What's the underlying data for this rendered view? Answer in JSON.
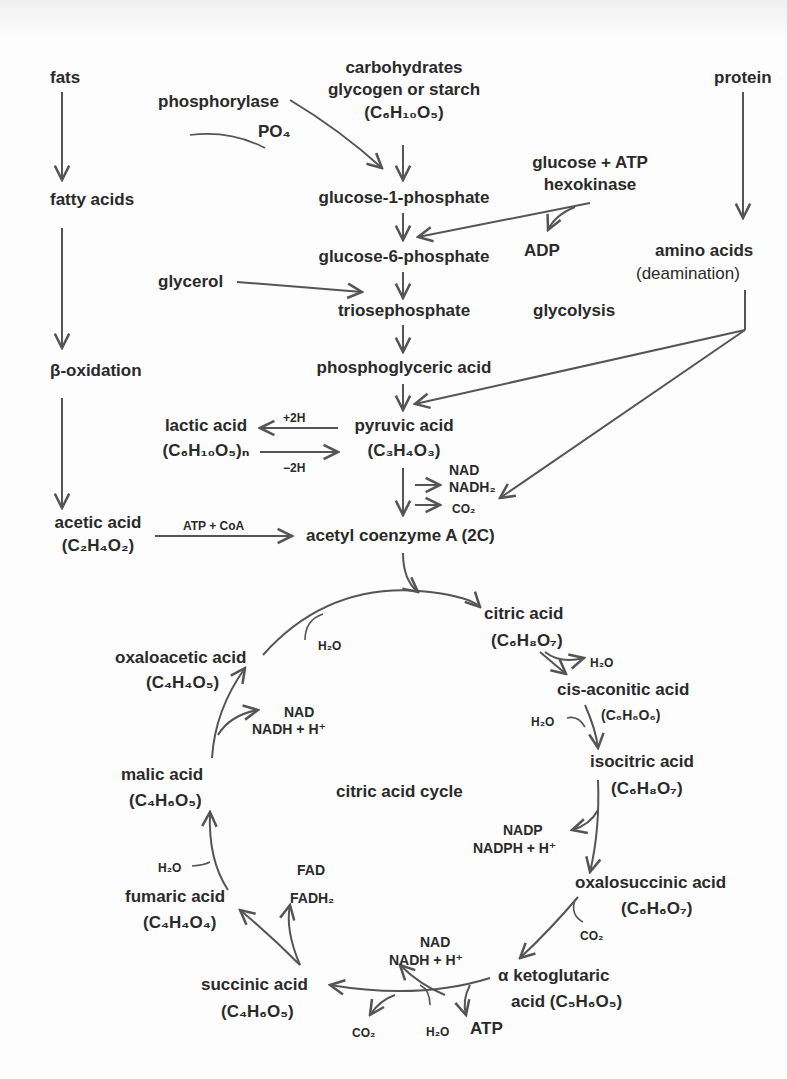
{
  "diagram": {
    "colors": {
      "ink": "#2a2a2a",
      "arrow": "#555555",
      "background": "#fdfdfd"
    },
    "sources": {
      "fats": "fats",
      "carbohydrates": "carbohydrates",
      "glycogen": "glycogen or starch",
      "glycogen_formula": "(C₆H₁₀O₅)",
      "protein": "protein"
    },
    "fat_pathway": {
      "fatty_acids": "fatty acids",
      "beta_oxidation": "β-oxidation",
      "acetic_acid": "acetic acid",
      "acetic_formula": "(C₂H₄O₂)",
      "atp_coa": "ATP + CoA"
    },
    "glycolysis": {
      "label": "glycolysis",
      "phosphorylase": "phosphorylase",
      "po4": "PO₄",
      "glucose_1_phosphate": "glucose-1-phosphate",
      "glucose_atp": "glucose + ATP",
      "hexokinase": "hexokinase",
      "adp": "ADP",
      "glucose_6_phosphate": "glucose-6-phosphate",
      "glycerol": "glycerol",
      "triosephosphate": "triosephosphate",
      "phosphoglyceric_acid": "phosphoglyceric acid",
      "pyruvic_acid": "pyruvic acid",
      "pyruvic_formula": "(C₃H₄O₃)",
      "lactic_acid": "lactic acid",
      "lactic_formula": "(C₆H₁₀O₅)ₙ",
      "plus_2h": "+2H",
      "minus_2h": "−2H",
      "nad": "NAD",
      "nadh2": "NADH₂",
      "co2": "CO₂",
      "acetyl_coa": "acetyl coenzyme A (2C)"
    },
    "protein_pathway": {
      "amino_acids": "amino acids",
      "deamination": "(deamination)"
    },
    "citric_acid_cycle": {
      "label": "citric acid cycle",
      "citric_acid": "citric acid",
      "citric_formula": "(C₆H₈O₇)",
      "h2o_out_citric": "H₂O",
      "cis_aconitic_acid": "cis-aconitic acid",
      "cis_aconitic_formula": "(C₆H₆O₆)",
      "h2o_in_aconitic": "H₂O",
      "isocitric_acid": "isocitric acid",
      "isocitric_formula": "(C₆H₈O₇)",
      "nadp": "NADP",
      "nadph": "NADPH + H⁺",
      "oxalosuccinic_acid": "oxalosuccinic acid",
      "oxalosuccinic_formula": "(C₆H₆O₇)",
      "co2_oxalo": "CO₂",
      "alpha_ketoglutaric": "α ketoglutaric",
      "alpha_ketoglutaric_formula": "acid (C₅H₆O₅)",
      "nad_kg": "NAD",
      "nadh_kg": "NADH + H⁺",
      "co2_kg": "CO₂",
      "h2o_kg": "H₂O",
      "atp": "ATP",
      "succinic_acid": "succinic acid",
      "succinic_formula": "(C₄H₆O₅)",
      "fad": "FAD",
      "fadh2": "FADH₂",
      "fumaric_acid": "fumaric acid",
      "fumaric_formula": "(C₄H₄O₄)",
      "h2o_fumaric": "H₂O",
      "malic_acid": "malic acid",
      "malic_formula": "(C₄H₆O₅)",
      "nad_malic": "NAD",
      "nadh_malic": "NADH + H⁺",
      "oxaloacetic_acid": "oxaloacetic acid",
      "oxaloacetic_formula": "(C₄H₄O₅)",
      "h2o_oxalo": "H₂O"
    }
  }
}
